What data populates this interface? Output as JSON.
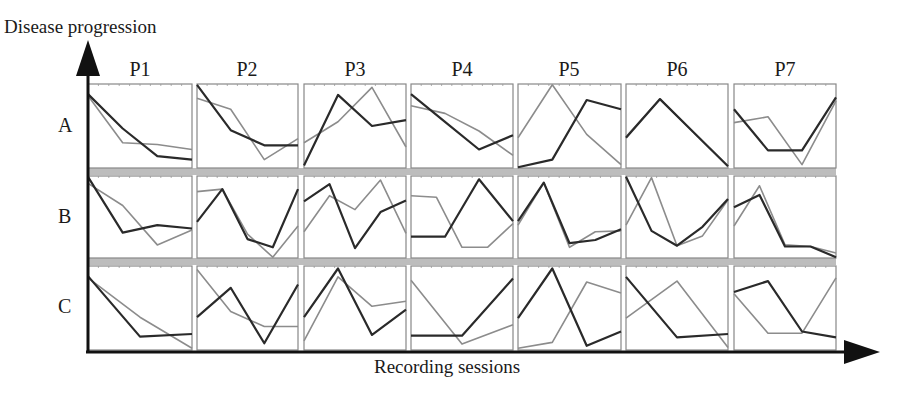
{
  "chart_data": {
    "type": "line",
    "title": "",
    "ylabel": "Disease progression",
    "xlabel": "Recording sessions",
    "columns": [
      "P1",
      "P2",
      "P3",
      "P4",
      "P5",
      "P6",
      "P7"
    ],
    "rows": [
      "A",
      "B",
      "C"
    ],
    "points_per_panel": 4,
    "value_range": [
      0,
      1
    ],
    "series_styles": {
      "dark": "#2a2a2a",
      "gray": "#8c8c8c"
    },
    "panels": {
      "A": {
        "P1": {
          "dark": [
            0.88,
            0.47,
            0.14,
            0.1
          ],
          "gray": [
            0.86,
            0.3,
            0.28,
            0.22
          ]
        },
        "P2": {
          "dark": [
            0.99,
            0.45,
            0.27,
            0.27
          ],
          "gray": [
            0.83,
            0.7,
            0.1,
            0.35
          ]
        },
        "P3": {
          "dark": [
            0.03,
            0.87,
            0.5,
            0.57
          ],
          "gray": [
            0.3,
            0.55,
            0.96,
            0.25
          ]
        },
        "P4": {
          "dark": [
            0.88,
            0.55,
            0.22,
            0.39
          ],
          "gray": [
            0.74,
            0.65,
            0.44,
            0.15
          ]
        },
        "P5": {
          "dark": [
            0.01,
            0.1,
            0.81,
            0.7
          ],
          "gray": [
            0.36,
            0.99,
            0.4,
            0.04
          ]
        },
        "P6": {
          "dark": [
            0.36,
            0.82,
            0.42,
            0.02
          ],
          "gray": [
            0.37,
            0.82,
            0.42,
            0.02
          ]
        },
        "P7": {
          "dark": [
            0.7,
            0.21,
            0.21,
            0.84
          ],
          "gray": [
            0.54,
            0.61,
            0.04,
            0.8
          ]
        }
      },
      "B": {
        "P1": {
          "dark": [
            0.99,
            0.31,
            0.4,
            0.36
          ],
          "gray": [
            0.91,
            0.64,
            0.16,
            0.34
          ]
        },
        "P2": {
          "dark": [
            0.44,
            0.84,
            0.23,
            0.13,
            0.84
          ],
          "gray": [
            0.81,
            0.84,
            0.29,
            0.01,
            0.39
          ]
        },
        "P3": {
          "dark": [
            0.69,
            0.9,
            0.12,
            0.56,
            0.7
          ],
          "gray": [
            0.32,
            0.76,
            0.59,
            0.95,
            0.3
          ]
        },
        "P4": {
          "dark": [
            0.26,
            0.26,
            0.96,
            0.45
          ],
          "gray": [
            0.76,
            0.74,
            0.13,
            0.13,
            0.42
          ]
        },
        "P5": {
          "dark": [
            0.45,
            0.92,
            0.18,
            0.22,
            0.35
          ],
          "gray": [
            0.4,
            0.92,
            0.13,
            0.32,
            0.33
          ]
        },
        "P6": {
          "dark": [
            0.99,
            0.33,
            0.15,
            0.38,
            0.72
          ],
          "gray": [
            0.4,
            0.98,
            0.15,
            0.27,
            0.71
          ]
        },
        "P7": {
          "dark": [
            0.62,
            0.77,
            0.14,
            0.14,
            0.01
          ],
          "gray": [
            0.39,
            0.88,
            0.16,
            0.14,
            0.06
          ]
        }
      },
      "C": {
        "P1": {
          "dark": [
            0.88,
            0.16,
            0.19
          ],
          "gray": [
            0.86,
            0.39,
            0.02
          ]
        },
        "P2": {
          "dark": [
            0.39,
            0.74,
            0.08,
            0.78
          ],
          "gray": [
            0.96,
            0.46,
            0.28,
            0.28
          ]
        },
        "P3": {
          "dark": [
            0.39,
            0.97,
            0.18,
            0.48
          ],
          "gray": [
            0.11,
            0.87,
            0.52,
            0.58
          ]
        },
        "P4": {
          "dark": [
            0.17,
            0.17,
            0.85
          ],
          "gray": [
            0.83,
            0.07,
            0.3
          ]
        },
        "P5": {
          "dark": [
            0.38,
            0.97,
            0.05,
            0.22
          ],
          "gray": [
            0.02,
            0.09,
            0.81,
            0.68
          ]
        },
        "P6": {
          "dark": [
            0.87,
            0.15,
            0.19
          ],
          "gray": [
            0.38,
            0.82,
            0.03
          ]
        },
        "P7": {
          "dark": [
            0.69,
            0.82,
            0.22,
            0.15
          ],
          "gray": [
            0.67,
            0.2,
            0.2,
            0.86
          ]
        }
      }
    },
    "axes": {
      "y_arrow": true,
      "x_arrow": true,
      "grid": false
    }
  },
  "labels": {
    "y_axis_title": "Disease progression",
    "x_axis_title": "Recording sessions",
    "columns": [
      "P1",
      "P2",
      "P3",
      "P4",
      "P5",
      "P6",
      "P7"
    ],
    "rows": [
      "A",
      "B",
      "C"
    ]
  },
  "colors": {
    "axis": "#111111",
    "panel_border": "#888888",
    "row_separator": "#bdbdbd",
    "dark_line": "#2a2a2a",
    "gray_line": "#8c8c8c"
  }
}
